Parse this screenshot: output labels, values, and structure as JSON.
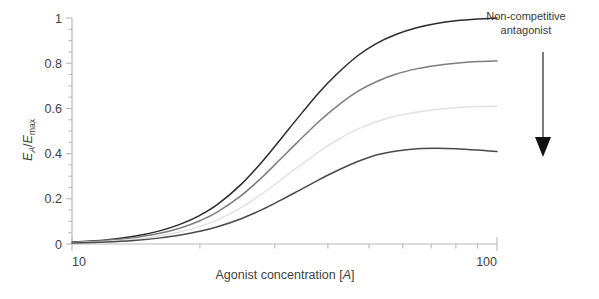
{
  "chart_data": {
    "type": "line",
    "title": "",
    "xlabel": "Agonist concentration [A]",
    "ylabel": "E_A/E_max",
    "xlabel_parts": {
      "main": "Agonist concentration [",
      "italic": "A",
      "tail": "]"
    },
    "ylabel_parts": {
      "e1": "E",
      "sub1": "A",
      "slash": "/",
      "e2": "E",
      "sub2": "max"
    },
    "xscale": "log",
    "xlim": [
      10,
      100
    ],
    "ylim": [
      0,
      1
    ],
    "xticks_major": [
      10,
      100
    ],
    "xticklabels": [
      "10",
      "100"
    ],
    "xticks_minor": [
      20,
      30,
      40,
      50,
      60,
      70,
      80,
      90
    ],
    "yticks_major": [
      0,
      0.2,
      0.4,
      0.6,
      0.8,
      1
    ],
    "yticklabels": [
      "0",
      "0.2",
      "0.4",
      "0.6",
      "0.8",
      "1"
    ],
    "yticks_minor_step": 0.05,
    "grid": false,
    "legend": "none",
    "series": [
      {
        "name": "No antagonist",
        "emax": 1.0,
        "ec50": 33,
        "hill": 4.2,
        "color": "#2b2b2b",
        "x": [
          10,
          12,
          14,
          16,
          18,
          20,
          22,
          25,
          28,
          31,
          34,
          38,
          42,
          47,
          52,
          58,
          65,
          72,
          80,
          90,
          100
        ],
        "values": [
          0.008,
          0.018,
          0.034,
          0.057,
          0.088,
          0.127,
          0.175,
          0.264,
          0.364,
          0.465,
          0.558,
          0.667,
          0.752,
          0.833,
          0.887,
          0.928,
          0.958,
          0.976,
          0.988,
          0.996,
          1.0
        ]
      },
      {
        "name": "Antagonist +",
        "emax": 0.81,
        "ec50": 33,
        "hill": 4.2,
        "color": "#7d7d7d",
        "x": [
          10,
          12,
          14,
          16,
          18,
          20,
          22,
          25,
          28,
          31,
          34,
          38,
          42,
          47,
          52,
          58,
          65,
          72,
          80,
          90,
          100
        ],
        "values": [
          0.006,
          0.015,
          0.028,
          0.046,
          0.071,
          0.103,
          0.142,
          0.214,
          0.295,
          0.377,
          0.452,
          0.54,
          0.609,
          0.675,
          0.718,
          0.752,
          0.776,
          0.79,
          0.8,
          0.807,
          0.81
        ]
      },
      {
        "name": "Antagonist ++",
        "emax": 0.61,
        "ec50": 33,
        "hill": 4.2,
        "color": "#e2e2e2",
        "x": [
          10,
          12,
          14,
          16,
          18,
          20,
          22,
          25,
          28,
          31,
          34,
          38,
          42,
          47,
          52,
          58,
          65,
          72,
          80,
          90,
          100
        ],
        "values": [
          0.005,
          0.011,
          0.021,
          0.035,
          0.054,
          0.078,
          0.107,
          0.161,
          0.222,
          0.284,
          0.34,
          0.407,
          0.459,
          0.508,
          0.541,
          0.566,
          0.584,
          0.595,
          0.603,
          0.608,
          0.61
        ]
      },
      {
        "name": "Antagonist +++",
        "emax": 0.42,
        "ec50": 35,
        "hill": 3.0,
        "color": "#4a4a4a",
        "x": [
          10,
          12,
          14,
          16,
          18,
          20,
          22,
          25,
          28,
          31,
          34,
          38,
          42,
          47,
          52,
          58,
          65,
          72,
          80,
          90,
          100
        ],
        "values": [
          0.004,
          0.009,
          0.016,
          0.026,
          0.04,
          0.056,
          0.076,
          0.112,
          0.152,
          0.194,
          0.234,
          0.283,
          0.324,
          0.365,
          0.394,
          0.412,
          0.422,
          0.424,
          0.422,
          0.416,
          0.409
        ]
      }
    ],
    "annotations": [
      {
        "name": "non-competitive-antagonist",
        "line1": "Non-competitive",
        "line2": "antagonist",
        "arrow": "down-arrow",
        "meaning": "increasing antagonist concentration"
      }
    ]
  },
  "colors": {
    "axis": "#b9b9b9",
    "text": "#3a3a3a",
    "arrow": "#111111",
    "background": "#ffffff"
  }
}
